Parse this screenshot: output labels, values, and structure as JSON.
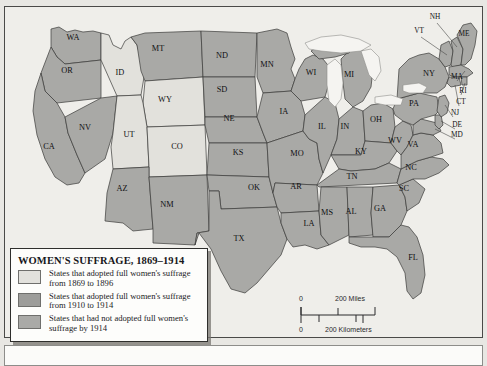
{
  "map": {
    "title": "Women's Suffrage map of the United States, 1869-1914",
    "colors": {
      "early_suffrage": "#e2e1dc",
      "late_suffrage": "#a9a9a6",
      "no_suffrage": "#a9a9a6",
      "water": "#f2f1ee",
      "land_outline": "#3b3b39",
      "background": "#efeeea",
      "frame": "#4a4a48"
    }
  },
  "legend": {
    "title": "WOMEN'S SUFFRAGE, 1869–1914",
    "items": [
      {
        "swatch_color": "#e2e1dc",
        "line1": "States that adopted full women's suffrage",
        "line2": "from 1869 to 1896"
      },
      {
        "swatch_color": "#9d9d9a",
        "line1": "States that adopted full women's suffrage",
        "line2": "from 1910 to 1914"
      },
      {
        "swatch_color": "#aaaaa7",
        "line1": "States that had not adopted full women's",
        "line2": "suffrage by 1914"
      }
    ]
  },
  "scalebar": {
    "miles_zero": "0",
    "miles_label": "200 Miles",
    "km_zero": "0",
    "km_label": "200 Kilometers"
  },
  "states": [
    {
      "code": "WA",
      "x": 72,
      "y": 37,
      "category": "late_suffrage"
    },
    {
      "code": "OR",
      "x": 66,
      "y": 70,
      "category": "late_suffrage"
    },
    {
      "code": "CA",
      "x": 48,
      "y": 146,
      "category": "late_suffrage"
    },
    {
      "code": "NV",
      "x": 84,
      "y": 127,
      "category": "late_suffrage"
    },
    {
      "code": "ID",
      "x": 119,
      "y": 72,
      "category": "early_suffrage"
    },
    {
      "code": "MT",
      "x": 157,
      "y": 48,
      "category": "late_suffrage"
    },
    {
      "code": "WY",
      "x": 164,
      "y": 99,
      "category": "early_suffrage"
    },
    {
      "code": "UT",
      "x": 128,
      "y": 134,
      "category": "early_suffrage"
    },
    {
      "code": "CO",
      "x": 176,
      "y": 146,
      "category": "early_suffrage"
    },
    {
      "code": "AZ",
      "x": 121,
      "y": 188,
      "category": "no_suffrage"
    },
    {
      "code": "NM",
      "x": 166,
      "y": 204,
      "category": "no_suffrage"
    },
    {
      "code": "ND",
      "x": 221,
      "y": 55,
      "category": "no_suffrage"
    },
    {
      "code": "SD",
      "x": 221,
      "y": 89,
      "category": "no_suffrage"
    },
    {
      "code": "NE",
      "x": 228,
      "y": 118,
      "category": "no_suffrage"
    },
    {
      "code": "KS",
      "x": 237,
      "y": 152,
      "category": "no_suffrage"
    },
    {
      "code": "OK",
      "x": 253,
      "y": 187,
      "category": "no_suffrage"
    },
    {
      "code": "TX",
      "x": 238,
      "y": 238,
      "category": "no_suffrage"
    },
    {
      "code": "MN",
      "x": 266,
      "y": 64,
      "category": "no_suffrage"
    },
    {
      "code": "IA",
      "x": 283,
      "y": 111,
      "category": "no_suffrage"
    },
    {
      "code": "MO",
      "x": 296,
      "y": 153,
      "category": "no_suffrage"
    },
    {
      "code": "AR",
      "x": 295,
      "y": 186,
      "category": "no_suffrage"
    },
    {
      "code": "LA",
      "x": 308,
      "y": 223,
      "category": "no_suffrage"
    },
    {
      "code": "WI",
      "x": 310,
      "y": 72,
      "category": "no_suffrage"
    },
    {
      "code": "IL",
      "x": 321,
      "y": 126,
      "category": "no_suffrage"
    },
    {
      "code": "MS",
      "x": 326,
      "y": 212,
      "category": "no_suffrage"
    },
    {
      "code": "MI",
      "x": 348,
      "y": 74,
      "category": "no_suffrage"
    },
    {
      "code": "IN",
      "x": 344,
      "y": 126,
      "category": "no_suffrage"
    },
    {
      "code": "KY",
      "x": 360,
      "y": 151,
      "category": "no_suffrage"
    },
    {
      "code": "TN",
      "x": 351,
      "y": 176,
      "category": "no_suffrage"
    },
    {
      "code": "AL",
      "x": 350,
      "y": 211,
      "category": "no_suffrage"
    },
    {
      "code": "OH",
      "x": 375,
      "y": 119,
      "category": "no_suffrage"
    },
    {
      "code": "GA",
      "x": 379,
      "y": 208,
      "category": "no_suffrage"
    },
    {
      "code": "WV",
      "x": 394,
      "y": 140,
      "category": "no_suffrage"
    },
    {
      "code": "SC",
      "x": 403,
      "y": 188,
      "category": "no_suffrage"
    },
    {
      "code": "NC",
      "x": 410,
      "y": 167,
      "category": "no_suffrage"
    },
    {
      "code": "VA",
      "x": 412,
      "y": 144,
      "category": "no_suffrage"
    },
    {
      "code": "PA",
      "x": 413,
      "y": 103,
      "category": "no_suffrage"
    },
    {
      "code": "NY",
      "x": 428,
      "y": 73,
      "category": "no_suffrage"
    },
    {
      "code": "FL",
      "x": 412,
      "y": 257,
      "category": "no_suffrage"
    }
  ],
  "leader_labels": [
    {
      "code": "NH",
      "x": 434,
      "y": 16
    },
    {
      "code": "VT",
      "x": 418,
      "y": 30
    },
    {
      "code": "ME",
      "x": 463,
      "y": 33
    },
    {
      "code": "MA",
      "x": 456,
      "y": 76
    },
    {
      "code": "RI",
      "x": 462,
      "y": 90
    },
    {
      "code": "CT",
      "x": 460,
      "y": 101
    },
    {
      "code": "NJ",
      "x": 454,
      "y": 112
    },
    {
      "code": "DE",
      "x": 456,
      "y": 124
    },
    {
      "code": "MD",
      "x": 456,
      "y": 134
    }
  ]
}
